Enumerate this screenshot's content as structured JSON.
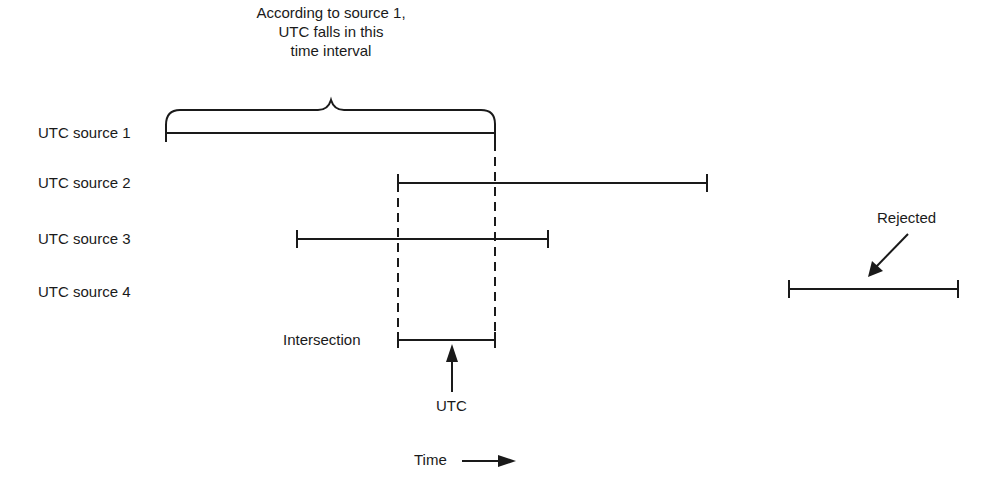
{
  "annotation": {
    "line1": "According to source 1,",
    "line2": "UTC falls in this",
    "line3": "time interval"
  },
  "sources": [
    {
      "label": "UTC source 1",
      "start": 166,
      "end": 495,
      "y": 133
    },
    {
      "label": "UTC source 2",
      "start": 398,
      "end": 707,
      "y": 183
    },
    {
      "label": "UTC source 3",
      "start": 297,
      "end": 548,
      "y": 239
    },
    {
      "label": "UTC source 4",
      "start": 789,
      "end": 958,
      "y": 289
    }
  ],
  "intersection": {
    "label": "Intersection",
    "start": 398,
    "end": 495,
    "y": 340
  },
  "utc_label": "UTC",
  "rejected_label": "Rejected",
  "time_label": "Time",
  "colors": {
    "ink": "#1a1a1a",
    "background": "#ffffff"
  }
}
